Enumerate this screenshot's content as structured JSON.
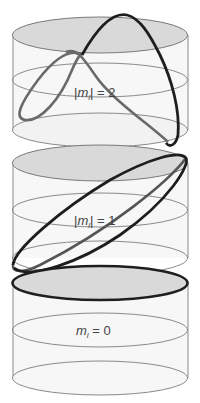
{
  "figure": {
    "cylinders": [
      {
        "id": "top",
        "label_parts": [
          "|",
          "m",
          "l",
          "| = 2"
        ],
        "label": "|ml| = 2",
        "curve": "two-turn helix (2 oscillations around circumference)"
      },
      {
        "id": "middle",
        "label_parts": [
          "|",
          "m",
          "l",
          "| = 1"
        ],
        "label": "|ml| = 1",
        "curve": "tilted ellipse (1 oscillation around circumference)"
      },
      {
        "id": "bottom",
        "label_parts": [
          "",
          "m",
          "l",
          " = 0"
        ],
        "label": "ml = 0",
        "curve": "flat circle on top face"
      }
    ],
    "colors": {
      "cap_fill": "#d9d9d9",
      "body_fill": "#f7f7f7",
      "outline": "#777777",
      "curve_dark": "#1a1a1a",
      "curve_mid": "#666666"
    }
  }
}
